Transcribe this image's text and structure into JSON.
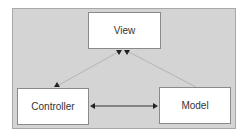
{
  "diagram": {
    "type": "MVC",
    "nodes": [
      {
        "id": "view",
        "label": "View"
      },
      {
        "id": "controller",
        "label": "Controller"
      },
      {
        "id": "model",
        "label": "Model"
      }
    ],
    "edges": [
      {
        "from": "view",
        "to": "controller",
        "style": "arrow-to-controller"
      },
      {
        "from": "controller",
        "to": "view",
        "style": "arrow-to-view"
      },
      {
        "from": "model",
        "to": "view",
        "style": "arrow-to-view"
      },
      {
        "from": "controller",
        "to": "model",
        "style": "bidirectional"
      }
    ],
    "colors": {
      "background": "#d4d4d4",
      "node_fill": "#ffffff",
      "line": "#b8b8b8",
      "arrow": "#222222"
    }
  }
}
